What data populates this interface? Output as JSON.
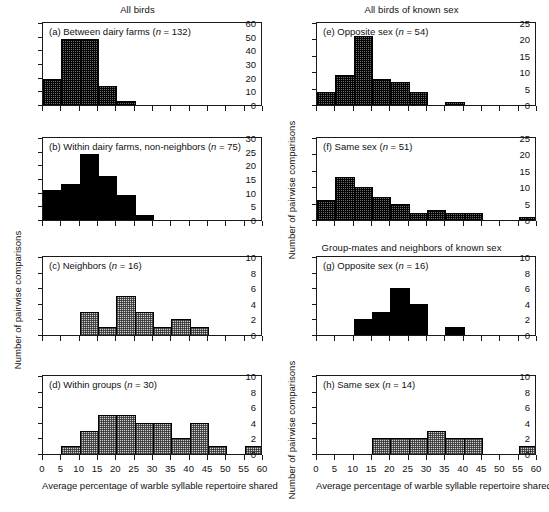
{
  "figure": {
    "column_titles": {
      "left": "All birds",
      "right_top": "All birds of known sex",
      "right_bottom": "Group-mates and neighbors of known sex"
    },
    "axis_titles": {
      "x": "Average percentage of warble syllable repertoire shared",
      "y": "Number of pairwise comparisons"
    }
  },
  "chart_data": [
    {
      "type": "bar",
      "panel": "a",
      "label_prefix": "(a)",
      "label_text": "Between dairy farms (",
      "label_n": "n",
      "label_n_value": " = 132)",
      "title": "(a) Between dairy farms (n = 132)",
      "group_title": "All birds",
      "n": 132,
      "fill": "dark",
      "xlabel": "Average percentage of warble syllable repertoire shared",
      "ylabel": "Number of pairwise comparisons",
      "xlim": [
        0,
        60
      ],
      "ylim": [
        0,
        60
      ],
      "xticks": [
        0,
        5,
        10,
        15,
        20,
        25,
        30,
        35,
        40,
        45,
        50,
        55,
        60
      ],
      "yticks": [
        0,
        10,
        20,
        30,
        40,
        50,
        60
      ],
      "bin_width": 5,
      "bins": [
        {
          "x0": 0,
          "x1": 5,
          "value": 19
        },
        {
          "x0": 5,
          "x1": 10,
          "value": 48
        },
        {
          "x0": 10,
          "x1": 15,
          "value": 48
        },
        {
          "x0": 15,
          "x1": 20,
          "value": 14
        },
        {
          "x0": 20,
          "x1": 25,
          "value": 3
        }
      ]
    },
    {
      "type": "bar",
      "panel": "b",
      "label_prefix": "(b)",
      "label_text": "Within dairy farms, non-neighbors (",
      "label_n": "n",
      "label_n_value": " = 75)",
      "title": "(b) Within dairy farms, non-neighbors (n = 75)",
      "n": 75,
      "fill": "solid",
      "xlim": [
        0,
        60
      ],
      "ylim": [
        0,
        30
      ],
      "xticks": [
        0,
        5,
        10,
        15,
        20,
        25,
        30,
        35,
        40,
        45,
        50,
        55,
        60
      ],
      "yticks": [
        0,
        5,
        10,
        15,
        20,
        25,
        30
      ],
      "bin_width": 5,
      "bins": [
        {
          "x0": 0,
          "x1": 5,
          "value": 11
        },
        {
          "x0": 5,
          "x1": 10,
          "value": 13
        },
        {
          "x0": 10,
          "x1": 15,
          "value": 24
        },
        {
          "x0": 15,
          "x1": 20,
          "value": 16
        },
        {
          "x0": 20,
          "x1": 25,
          "value": 9
        },
        {
          "x0": 25,
          "x1": 30,
          "value": 2
        }
      ]
    },
    {
      "type": "bar",
      "panel": "c",
      "label_prefix": "(c)",
      "label_text": "Neighbors (",
      "label_n": "n",
      "label_n_value": " = 16)",
      "title": "(c) Neighbors (n = 16)",
      "n": 16,
      "fill": "light",
      "xlim": [
        0,
        60
      ],
      "ylim": [
        0,
        10
      ],
      "xticks": [
        0,
        5,
        10,
        15,
        20,
        25,
        30,
        35,
        40,
        45,
        50,
        55,
        60
      ],
      "yticks": [
        0,
        2,
        4,
        6,
        8,
        10
      ],
      "bin_width": 5,
      "bins": [
        {
          "x0": 10,
          "x1": 15,
          "value": 3
        },
        {
          "x0": 15,
          "x1": 20,
          "value": 1
        },
        {
          "x0": 20,
          "x1": 25,
          "value": 5
        },
        {
          "x0": 25,
          "x1": 30,
          "value": 3
        },
        {
          "x0": 30,
          "x1": 35,
          "value": 1
        },
        {
          "x0": 35,
          "x1": 40,
          "value": 2
        },
        {
          "x0": 40,
          "x1": 45,
          "value": 1
        }
      ]
    },
    {
      "type": "bar",
      "panel": "d",
      "label_prefix": "(d)",
      "label_text": "Within groups (",
      "label_n": "n",
      "label_n_value": " = 30)",
      "title": "(d) Within groups (n = 30)",
      "n": 30,
      "fill": "light",
      "xlim": [
        0,
        60
      ],
      "ylim": [
        0,
        10
      ],
      "xticks": [
        0,
        5,
        10,
        15,
        20,
        25,
        30,
        35,
        40,
        45,
        50,
        55,
        60
      ],
      "yticks": [
        0,
        2,
        4,
        6,
        8,
        10
      ],
      "bin_width": 5,
      "bins": [
        {
          "x0": 5,
          "x1": 10,
          "value": 1
        },
        {
          "x0": 10,
          "x1": 15,
          "value": 3
        },
        {
          "x0": 15,
          "x1": 20,
          "value": 5
        },
        {
          "x0": 20,
          "x1": 25,
          "value": 5
        },
        {
          "x0": 25,
          "x1": 30,
          "value": 4
        },
        {
          "x0": 30,
          "x1": 35,
          "value": 4
        },
        {
          "x0": 35,
          "x1": 40,
          "value": 2
        },
        {
          "x0": 40,
          "x1": 45,
          "value": 4
        },
        {
          "x0": 45,
          "x1": 50,
          "value": 1
        },
        {
          "x0": 55,
          "x1": 60,
          "value": 1
        }
      ]
    },
    {
      "type": "bar",
      "panel": "e",
      "label_prefix": "(e)",
      "label_text": "Opposite sex (",
      "label_n": "n",
      "label_n_value": " = 54)",
      "title": "(e) Opposite sex (n = 54)",
      "group_title": "All birds of known sex",
      "n": 54,
      "fill": "dark",
      "xlim": [
        0,
        60
      ],
      "ylim": [
        0,
        25
      ],
      "xticks": [
        0,
        5,
        10,
        15,
        20,
        25,
        30,
        35,
        40,
        45,
        50,
        55,
        60
      ],
      "yticks": [
        0,
        5,
        10,
        15,
        20,
        25
      ],
      "bin_width": 5,
      "bins": [
        {
          "x0": 0,
          "x1": 5,
          "value": 4
        },
        {
          "x0": 5,
          "x1": 10,
          "value": 9
        },
        {
          "x0": 10,
          "x1": 15,
          "value": 21
        },
        {
          "x0": 15,
          "x1": 20,
          "value": 8
        },
        {
          "x0": 20,
          "x1": 25,
          "value": 7
        },
        {
          "x0": 25,
          "x1": 30,
          "value": 4
        },
        {
          "x0": 35,
          "x1": 40,
          "value": 1
        }
      ]
    },
    {
      "type": "bar",
      "panel": "f",
      "label_prefix": "(f)",
      "label_text": "Same sex (",
      "label_n": "n",
      "label_n_value": " = 51)",
      "title": "(f) Same sex (n = 51)",
      "n": 51,
      "fill": "dark",
      "xlim": [
        0,
        60
      ],
      "ylim": [
        0,
        25
      ],
      "xticks": [
        0,
        5,
        10,
        15,
        20,
        25,
        30,
        35,
        40,
        45,
        50,
        55,
        60
      ],
      "yticks": [
        0,
        5,
        10,
        15,
        20,
        25
      ],
      "bin_width": 5,
      "bins": [
        {
          "x0": 0,
          "x1": 5,
          "value": 6
        },
        {
          "x0": 5,
          "x1": 10,
          "value": 13
        },
        {
          "x0": 10,
          "x1": 15,
          "value": 10
        },
        {
          "x0": 15,
          "x1": 20,
          "value": 7
        },
        {
          "x0": 20,
          "x1": 25,
          "value": 5
        },
        {
          "x0": 25,
          "x1": 30,
          "value": 2
        },
        {
          "x0": 30,
          "x1": 35,
          "value": 3
        },
        {
          "x0": 35,
          "x1": 40,
          "value": 2
        },
        {
          "x0": 40,
          "x1": 45,
          "value": 2
        },
        {
          "x0": 55,
          "x1": 60,
          "value": 1
        }
      ]
    },
    {
      "type": "bar",
      "panel": "g",
      "label_prefix": "(g)",
      "label_text": "Opposite sex (",
      "label_n": "n",
      "label_n_value": " = 16)",
      "title": "(g) Opposite sex (n = 16)",
      "group_title": "Group-mates and neighbors of known sex",
      "n": 16,
      "fill": "solid",
      "xlim": [
        0,
        60
      ],
      "ylim": [
        0,
        10
      ],
      "xticks": [
        0,
        5,
        10,
        15,
        20,
        25,
        30,
        35,
        40,
        45,
        50,
        55,
        60
      ],
      "yticks": [
        0,
        2,
        4,
        6,
        8,
        10
      ],
      "bin_width": 5,
      "bins": [
        {
          "x0": 10,
          "x1": 15,
          "value": 2
        },
        {
          "x0": 15,
          "x1": 20,
          "value": 3
        },
        {
          "x0": 20,
          "x1": 25,
          "value": 6
        },
        {
          "x0": 25,
          "x1": 30,
          "value": 4
        },
        {
          "x0": 35,
          "x1": 40,
          "value": 1
        }
      ]
    },
    {
      "type": "bar",
      "panel": "h",
      "label_prefix": "(h)",
      "label_text": "Same sex (",
      "label_n": "n",
      "label_n_value": " = 14)",
      "title": "(h) Same sex (n = 14)",
      "n": 14,
      "fill": "light",
      "xlim": [
        0,
        60
      ],
      "ylim": [
        0,
        10
      ],
      "xticks": [
        0,
        5,
        10,
        15,
        20,
        25,
        30,
        35,
        40,
        45,
        50,
        55,
        60
      ],
      "yticks": [
        0,
        2,
        4,
        6,
        8,
        10
      ],
      "bin_width": 5,
      "bins": [
        {
          "x0": 15,
          "x1": 20,
          "value": 2
        },
        {
          "x0": 20,
          "x1": 25,
          "value": 2
        },
        {
          "x0": 25,
          "x1": 30,
          "value": 2
        },
        {
          "x0": 30,
          "x1": 35,
          "value": 3
        },
        {
          "x0": 35,
          "x1": 40,
          "value": 2
        },
        {
          "x0": 40,
          "x1": 45,
          "value": 2
        },
        {
          "x0": 55,
          "x1": 60,
          "value": 1
        }
      ]
    }
  ]
}
